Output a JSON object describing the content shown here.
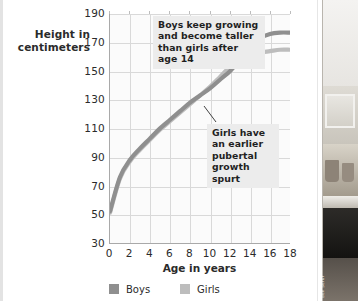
{
  "figure": {
    "y_axis_title": "Height in\ncentimeters",
    "x_axis_title": "Age in years",
    "annotations": [
      {
        "id": "boys",
        "text": "Boys keep growing and become taller than girls after age 14"
      },
      {
        "id": "girls",
        "text": "Girls have an earlier pubertal growth spurt"
      }
    ],
    "legend": [
      {
        "label": "Boys",
        "color": "#8f8f8f"
      },
      {
        "label": "Girls",
        "color": "#bdbdbd"
      }
    ]
  },
  "photo": {
    "credit": "Ben Serur"
  },
  "chart_data": {
    "type": "line",
    "title": "",
    "xlabel": "Age in years",
    "ylabel": "Height in centimeters",
    "xlim": [
      0,
      18
    ],
    "ylim": [
      30,
      190
    ],
    "xticks": [
      0,
      2,
      4,
      6,
      8,
      10,
      12,
      14,
      16,
      18
    ],
    "yticks": [
      30,
      50,
      70,
      90,
      110,
      130,
      150,
      170,
      190
    ],
    "grid": true,
    "legend_position": "bottom-left",
    "x": [
      0,
      1,
      2,
      3,
      4,
      5,
      6,
      7,
      8,
      9,
      10,
      11,
      12,
      13,
      14,
      15,
      16,
      17,
      18
    ],
    "series": [
      {
        "name": "Boys",
        "color": "#8f8f8f",
        "values": [
          52,
          76,
          88,
          96,
          103,
          110,
          116,
          122,
          128,
          133,
          138,
          144,
          150,
          158,
          167,
          173,
          176,
          177,
          177
        ]
      },
      {
        "name": "Girls",
        "color": "#bdbdbd",
        "values": [
          51,
          75,
          87,
          95,
          102,
          109,
          115,
          121,
          127,
          133,
          139,
          146,
          153,
          158,
          161,
          163,
          164,
          165,
          165
        ]
      }
    ],
    "annotations": [
      {
        "text": "Boys keep growing and become taller than girls after age 14",
        "points_to_x": 14.5,
        "points_to_y": 170
      },
      {
        "text": "Girls have an earlier pubertal growth spurt",
        "points_to_x": 11.5,
        "points_to_y": 148
      }
    ]
  }
}
